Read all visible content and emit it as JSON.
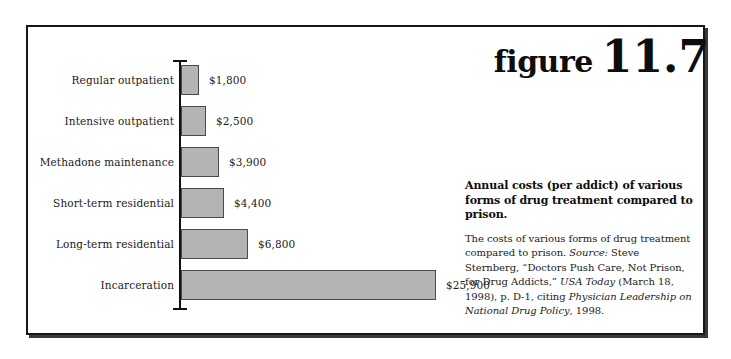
{
  "figure": {
    "word": "figure",
    "number": "11.7"
  },
  "chart_data": {
    "type": "bar",
    "orientation": "horizontal",
    "title": "Annual costs (per addict) of various forms of drug treatment compared to prison.",
    "xlabel": "",
    "ylabel": "",
    "xlim": [
      0,
      25900
    ],
    "grid": false,
    "legend": "none",
    "categories": [
      "Regular outpatient",
      "Intensive outpatient",
      "Methadone maintenance",
      "Short-term residential",
      "Long-term residential",
      "Incarceration"
    ],
    "values": [
      1800,
      2500,
      3900,
      4400,
      6800,
      25900
    ],
    "value_labels": [
      "$1,800",
      "$2,500",
      "$3,900",
      "$4,400",
      "$6,800",
      "$25,900"
    ],
    "bar_color": "#b4b4b4",
    "bar_border_color": "#4a4a4a",
    "axis_color": "#111111"
  },
  "caption": {
    "title": "Annual costs (per addict) of various forms of drug treatment compared to prison.",
    "body_parts": [
      {
        "text": "The costs of various forms of drug treatment compared to prison. ",
        "italic": false
      },
      {
        "text": "Source:",
        "italic": true
      },
      {
        "text": " Steve Sternberg, “Doctors Push Care, Not Prison, for Drug Addicts,” ",
        "italic": false
      },
      {
        "text": "USA Today",
        "italic": true
      },
      {
        "text": " (March 18, 1998), p. D-1, citing ",
        "italic": false
      },
      {
        "text": "Physician Leadership on National Drug Policy",
        "italic": true
      },
      {
        "text": ", 1998.",
        "italic": false
      }
    ]
  }
}
